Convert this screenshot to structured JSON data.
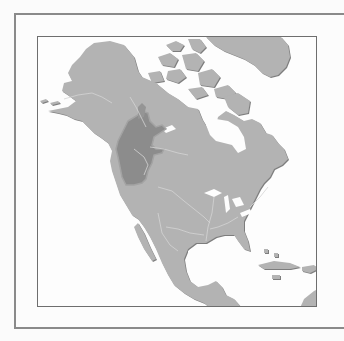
{
  "map": {
    "title": "",
    "region": "North America",
    "highlighted_region": "Pacific Northwest (British Columbia, Washington, Oregon)",
    "colors": {
      "background": "#fdfdfd",
      "land": "#b3b3b3",
      "land_shadow": "#7a7a7a",
      "highlight": "#8c8c8c",
      "highlight_border": "#a0a0a0",
      "rivers": "#d2d2d2",
      "frame": "#8a8a8a"
    },
    "features": [
      "Alaska",
      "Canada",
      "Arctic Archipelago",
      "Greenland",
      "Hudson Bay",
      "Great Lakes",
      "United States",
      "Mexico",
      "Gulf of Mexico",
      "Caribbean islands",
      "Central America"
    ]
  }
}
